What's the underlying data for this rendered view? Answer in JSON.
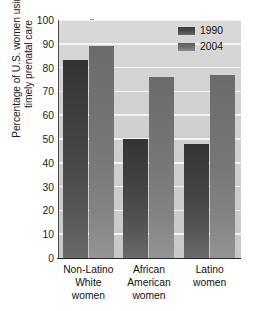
{
  "chart_data": {
    "type": "bar",
    "title": "",
    "xlabel": "",
    "ylabel_lines": [
      "Percentage of U.S. women using",
      "timely prenatal care"
    ],
    "ylabel": "Percentage of U.S. women using timely prenatal care",
    "categories": [
      "Non-Latino White women",
      "African American women",
      "Latino women"
    ],
    "category_lines": [
      [
        "Non-Latino",
        "White",
        "women"
      ],
      [
        "African",
        "American",
        "women"
      ],
      [
        "Latino",
        "women",
        ""
      ]
    ],
    "series": [
      {
        "name": "1990",
        "values": [
          83,
          50,
          48
        ],
        "color": "#3f3f3f"
      },
      {
        "name": "2004",
        "values": [
          89,
          76,
          77
        ],
        "color": "#767676"
      }
    ],
    "ylim": [
      0,
      100
    ],
    "ytick_values": [
      0,
      10,
      20,
      30,
      40,
      50,
      60,
      70,
      80,
      90,
      100
    ],
    "ytick_labels": [
      "0",
      "10",
      "20",
      "30",
      "40",
      "50",
      "60",
      "70",
      "80",
      "90",
      "100"
    ],
    "grid": true,
    "grid_color": "#f4f4f4",
    "plot_background": "#d2d2d2",
    "legend_position": "top-right",
    "legend_entries": [
      "1990",
      "2004"
    ]
  }
}
